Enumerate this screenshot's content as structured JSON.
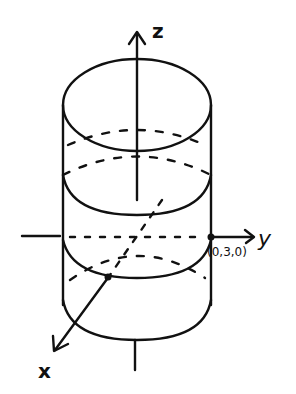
{
  "diagram": {
    "type": "3d-coordinate-sketch",
    "stroke_color": "#111111",
    "background": "#ffffff",
    "axes": {
      "z": {
        "label": "z"
      },
      "y": {
        "label": "y"
      },
      "x": {
        "label": "x"
      }
    },
    "point": {
      "label": "(0,3,0)"
    },
    "cylinder": {
      "rings": [
        "top",
        "upper-middle",
        "equator",
        "lower-middle",
        "bottom"
      ]
    }
  }
}
